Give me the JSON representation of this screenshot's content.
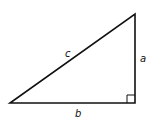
{
  "diagram": {
    "type": "right-triangle",
    "stroke_color": "#111111",
    "background": "#ffffff",
    "vertices": {
      "bottom_left": [
        10,
        103
      ],
      "bottom_right": [
        135,
        103
      ],
      "top": [
        135,
        14
      ]
    },
    "right_angle_marker": {
      "corner": "bottom_right",
      "size": 8
    },
    "labels": {
      "hypotenuse": "c",
      "vertical_leg": "a",
      "horizontal_leg": "b"
    }
  }
}
